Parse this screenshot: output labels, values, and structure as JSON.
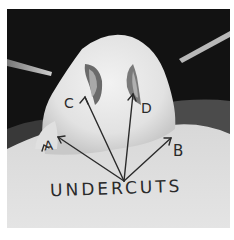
{
  "image": {
    "description": "Black-and-white photograph of a plaster nose mold with hand-drawn arrows indicating undercut areas",
    "colors": {
      "background": "#111111",
      "mold": "#e6e6e6",
      "base": "#dcdcdc",
      "ink": "#2a2a2a",
      "border": "#ffffff"
    }
  },
  "labels": {
    "a": "A",
    "b": "B",
    "c": "C",
    "d": "D",
    "caption": "UNDERCUTS"
  }
}
